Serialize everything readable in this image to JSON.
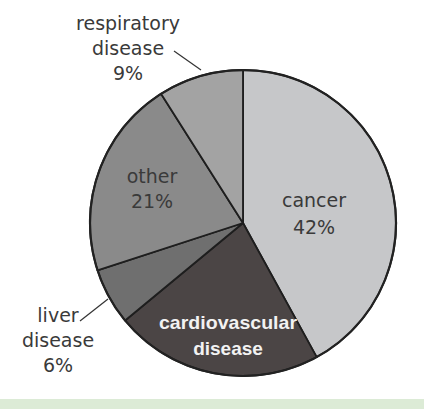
{
  "chart_data": {
    "type": "pie",
    "title": "",
    "start_angle_deg": 0,
    "direction": "clockwise",
    "slices": [
      {
        "label": "cancer",
        "label_lines": [
          "cancer",
          "42%"
        ],
        "value": 42,
        "color": "#c6c7c9"
      },
      {
        "label": "cardiovascular disease",
        "label_lines": [
          "cardiovascular",
          "disease"
        ],
        "value": 22,
        "color": "#4b4545",
        "value_shown": false
      },
      {
        "label": "liver disease",
        "label_lines": [
          "liver",
          "disease",
          "6%"
        ],
        "value": 6,
        "color": "#6f6f6f"
      },
      {
        "label": "other",
        "label_lines": [
          "other",
          "21%"
        ],
        "value": 21,
        "color": "#8a8a8a"
      },
      {
        "label": "respiratory disease",
        "label_lines": [
          "respiratory",
          "disease",
          "9%"
        ],
        "value": 9,
        "color": "#a3a3a3"
      }
    ],
    "legend": "none",
    "labels": {
      "cancer": {
        "line1": "cancer",
        "line2": "42%"
      },
      "cardio": {
        "line1": "cardiovascular",
        "line2": "disease"
      },
      "liver": {
        "line1": "liver",
        "line2": "disease",
        "line3": "6%"
      },
      "other": {
        "line1": "other",
        "line2": "21%"
      },
      "respiratory": {
        "line1": "respiratory",
        "line2": "disease",
        "line3": "9%"
      }
    }
  },
  "footer_band_color": "#dcebd6"
}
